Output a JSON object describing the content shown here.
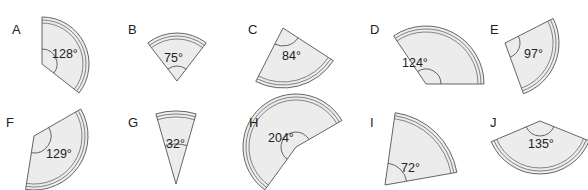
{
  "figure": {
    "colors": {
      "fill": "#ececec",
      "stroke": "#555555",
      "text": "#222222"
    },
    "sectors": [
      {
        "letter": "A",
        "angle_label": "128°",
        "angle": 128,
        "letter_pos": [
          12,
          34
        ],
        "center": [
          42,
          64
        ],
        "radius": 47,
        "start": -90,
        "label_pos": [
          52,
          58
        ],
        "arc_r": 15
      },
      {
        "letter": "B",
        "angle_label": "75°",
        "angle": 75,
        "letter_pos": [
          128,
          34
        ],
        "center": [
          177,
          81
        ],
        "radius": 48,
        "start": -127.5,
        "label_pos": [
          164,
          62
        ],
        "arc_r": 15
      },
      {
        "letter": "C",
        "angle_label": "84°",
        "angle": 84,
        "letter_pos": [
          248,
          34
        ],
        "center": [
          283,
          28
        ],
        "radius": 60,
        "start": 33,
        "label_pos": [
          282,
          60
        ],
        "arc_r": 18
      },
      {
        "letter": "D",
        "angle_label": "124°",
        "angle": 124,
        "letter_pos": [
          370,
          34
        ],
        "center": [
          426,
          84
        ],
        "radius": 58,
        "start": -124,
        "label_pos": [
          402,
          67
        ],
        "arc_r": 15
      },
      {
        "letter": "E",
        "angle_label": "97°",
        "angle": 97,
        "letter_pos": [
          490,
          34
        ],
        "center": [
          505,
          43
        ],
        "radius": 54,
        "start": -27,
        "label_pos": [
          524,
          58
        ],
        "arc_r": 15
      },
      {
        "letter": "F",
        "angle_label": "129°",
        "angle": 129,
        "letter_pos": [
          6,
          127
        ],
        "center": [
          34,
          136
        ],
        "radius": 54,
        "start": -30,
        "label_pos": [
          46,
          158
        ],
        "arc_r": 17
      },
      {
        "letter": "G",
        "angle_label": "32°",
        "angle": 32,
        "letter_pos": [
          128,
          127
        ],
        "center": [
          176,
          184
        ],
        "radius": 73,
        "start": -106,
        "label_pos": [
          166,
          148
        ],
        "arc_r": 40
      },
      {
        "letter": "H",
        "angle_label": "204°",
        "angle": 204,
        "letter_pos": [
          249,
          127
        ],
        "center": [
          296,
          147
        ],
        "radius": 53,
        "start": 126,
        "label_pos": [
          268,
          142
        ],
        "arc_r": 15
      },
      {
        "letter": "I",
        "angle_label": "72°",
        "angle": 72,
        "letter_pos": [
          370,
          127
        ],
        "center": [
          385,
          185
        ],
        "radius": 73,
        "start": -82,
        "label_pos": [
          401,
          172
        ],
        "arc_r": 22
      },
      {
        "letter": "J",
        "angle_label": "135°",
        "angle": 135,
        "letter_pos": [
          490,
          127
        ],
        "center": [
          540,
          121
        ],
        "radius": 53,
        "start": 22,
        "label_pos": [
          528,
          148
        ],
        "arc_r": 15
      }
    ]
  }
}
